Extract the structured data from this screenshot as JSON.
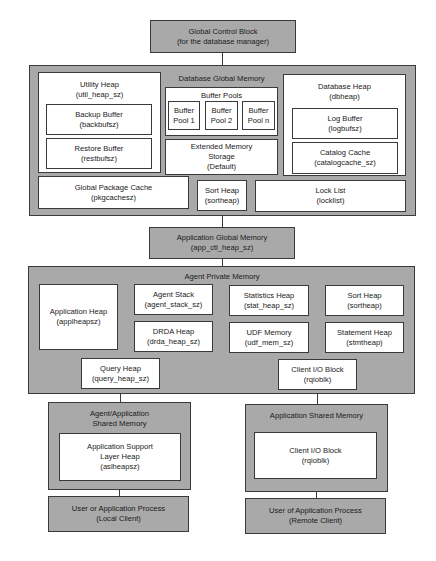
{
  "diagram": {
    "global_control_block": {
      "title": "Global Control Block",
      "sub": "(for the database manager)"
    },
    "database_global_memory": {
      "title": "Database Global Memory",
      "utility_heap": {
        "title": "Utility Heap",
        "sub": "(util_heap_sz)"
      },
      "backup_buffer": {
        "title": "Backup Buffer",
        "sub": "(backbufsz)"
      },
      "restore_buffer": {
        "title": "Restore Buffer",
        "sub": "(restbufsz)"
      },
      "buffer_pools": {
        "title": "Buffer Pools",
        "pools": [
          {
            "line1": "Buffer",
            "line2": "Pool 1"
          },
          {
            "line1": "Buffer",
            "line2": "Pool 2"
          },
          {
            "line1": "Buffer",
            "line2": "Pool n"
          }
        ]
      },
      "extended_memory": {
        "line1": "Extended Memory",
        "line2": "Storage",
        "line3": "(Default)"
      },
      "database_heap": {
        "title": "Database Heap",
        "sub": "(dbheap)"
      },
      "log_buffer": {
        "title": "Log Buffer",
        "sub": "(logbufsz)"
      },
      "catalog_cache": {
        "title": "Catalog Cache",
        "sub": "(catalogcache_sz)"
      },
      "global_package_cache": {
        "title": "Global Package Cache",
        "sub": "(pkgcachesz)"
      },
      "sort_heap": {
        "title": "Sort Heap",
        "sub": "(sortheap)"
      },
      "lock_list": {
        "title": "Lock List",
        "sub": "(locklist)"
      }
    },
    "application_global_memory": {
      "title": "Application Global Memory",
      "sub": "(app_ctl_heap_sz)"
    },
    "agent_private_memory": {
      "title": "Agent Private Memory",
      "application_heap": {
        "title": "Application Heap",
        "sub": "(applheapsz)"
      },
      "agent_stack": {
        "title": "Agent Stack",
        "sub": "(agent_stack_sz)"
      },
      "drda_heap": {
        "title": "DRDA Heap",
        "sub": "(drda_heap_sz)"
      },
      "statistics_heap": {
        "title": "Statistics Heap",
        "sub": "(stat_heap_sz)"
      },
      "udf_memory": {
        "title": "UDF Memory",
        "sub": "(udf_mem_sz)"
      },
      "sort_heap": {
        "title": "Sort Heap",
        "sub": "(sortheap)"
      },
      "statement_heap": {
        "title": "Statement Heap",
        "sub": "(stmtheap)"
      },
      "query_heap": {
        "title": "Query Heap",
        "sub": "(query_heap_sz)"
      },
      "client_io_block": {
        "title": "Client I/O Block",
        "sub": "(rqioblk)"
      }
    },
    "agent_app_shared_memory": {
      "line1": "Agent/Application",
      "line2": "Shared Memory",
      "asl_heap": {
        "line1": "Application Support",
        "line2": "Layer Heap",
        "line3": "(aslheapsz)"
      }
    },
    "application_shared_memory": {
      "title": "Application Shared Memory",
      "client_io_block": {
        "title": "Client I/O Block",
        "sub": "(rqioblk)"
      }
    },
    "local_client": {
      "title": "User or Application Process",
      "sub": "(Local Client)"
    },
    "remote_client": {
      "title": "User of Application Process",
      "sub": "(Remote Client)"
    }
  },
  "colors": {
    "container_gray": "#a9a9a9",
    "box_white": "#ffffff",
    "border": "#3a3a3a"
  }
}
